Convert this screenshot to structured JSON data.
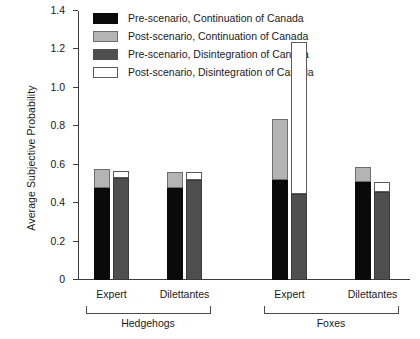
{
  "chart_data": {
    "type": "bar",
    "title": "",
    "xlabel": "",
    "ylabel": "Average Subjective Probability",
    "ylim": [
      0,
      1.4
    ],
    "ytick_labels": [
      "0",
      "0.2",
      "0.4",
      "0.6",
      "0.8",
      "1.0",
      "1.2",
      "1.4"
    ],
    "ytick_values": [
      0,
      0.2,
      0.4,
      0.6,
      0.8,
      1.0,
      1.2,
      1.4
    ],
    "grid": false,
    "stacked": true,
    "legend_position": "top-left",
    "legend": [
      "Pre-scenario, Continuation of Canada",
      "Post-scenario, Continuation of Canada",
      "Pre-scenario, Disintegration of Canada",
      "Post-scenario, Disintegration of Canada"
    ],
    "colors": {
      "pre_continuation": "#0a0a0a",
      "post_continuation": "#b4b4b4",
      "pre_disintegration": "#4f4f4f",
      "post_disintegration": "#ffffff"
    },
    "groups": [
      {
        "name": "Hedgehogs",
        "categories": [
          {
            "label": "Expert",
            "bars": [
              {
                "name": "continuation",
                "pre": 0.48,
                "post_total": 0.58
              },
              {
                "name": "disintegration",
                "pre": 0.53,
                "post_total": 0.57
              }
            ]
          },
          {
            "label": "Dilettantes",
            "bars": [
              {
                "name": "continuation",
                "pre": 0.48,
                "post_total": 0.56
              },
              {
                "name": "disintegration",
                "pre": 0.52,
                "post_total": 0.56
              }
            ]
          }
        ]
      },
      {
        "name": "Foxes",
        "categories": [
          {
            "label": "Expert",
            "bars": [
              {
                "name": "continuation",
                "pre": 0.52,
                "post_total": 0.84
              },
              {
                "name": "disintegration",
                "pre": 0.45,
                "post_total": 1.24
              }
            ]
          },
          {
            "label": "Dilettantes",
            "bars": [
              {
                "name": "continuation",
                "pre": 0.51,
                "post_total": 0.59
              },
              {
                "name": "disintegration",
                "pre": 0.46,
                "post_total": 0.51
              }
            ]
          }
        ]
      }
    ]
  }
}
